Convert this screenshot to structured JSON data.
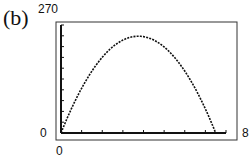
{
  "panel_label": "(b)",
  "chart_data": {
    "type": "line",
    "title": "",
    "xlabel": "",
    "ylabel": "",
    "xlim": [
      0,
      8
    ],
    "ylim": [
      0,
      270
    ],
    "x_ticks_step": 1,
    "y_ticks_step": 27,
    "tick_labels": {
      "x_min": "0",
      "x_max": "8",
      "y_min": "0",
      "y_max": "270"
    },
    "grid": false,
    "series": [
      {
        "name": "curve",
        "style": "dotted",
        "x": [
          0,
          1,
          2,
          3,
          4,
          5,
          6,
          7,
          7.5
        ],
        "y": [
          0,
          120,
          200,
          240,
          242,
          215,
          160,
          70,
          0
        ]
      }
    ]
  }
}
